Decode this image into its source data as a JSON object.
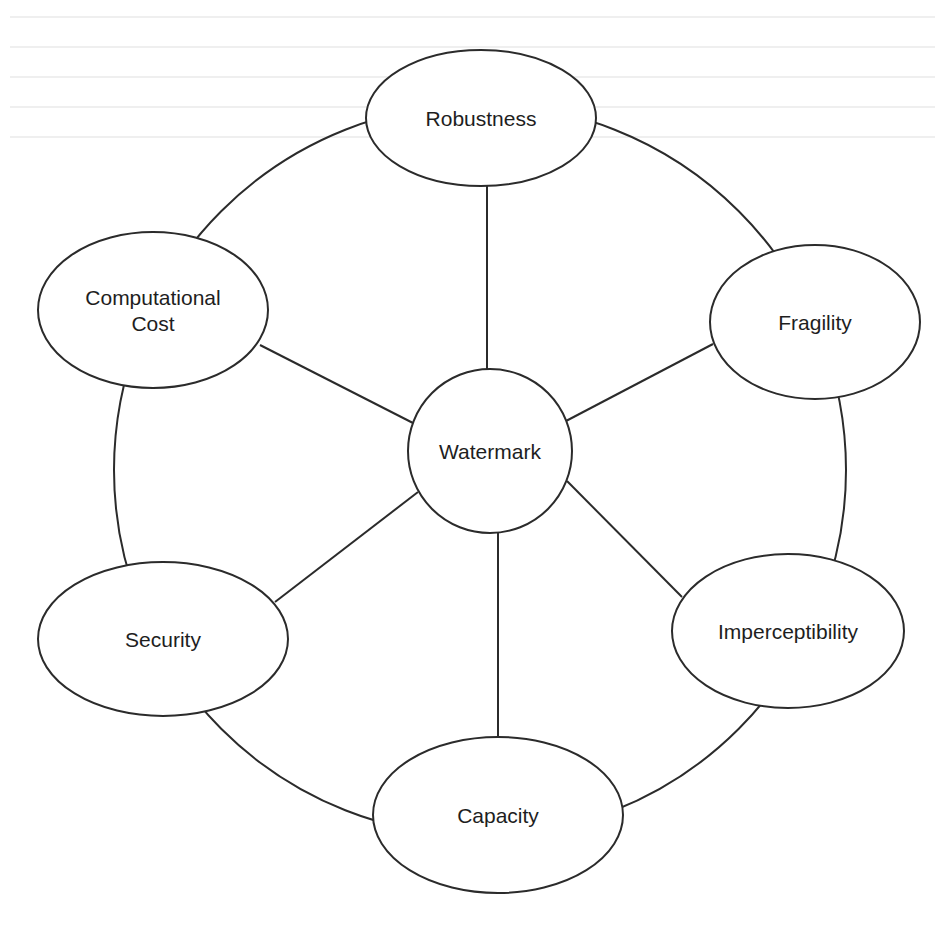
{
  "diagram": {
    "type": "hub-and-spoke concept diagram with outer ring",
    "center": {
      "id": "watermark",
      "label": "Watermark",
      "shape": "circle",
      "cx": 490,
      "cy": 451,
      "r": 82
    },
    "outer_ring": {
      "cx": 480,
      "cy": 470,
      "r": 366
    },
    "nodes": [
      {
        "id": "robustness",
        "label": "Robustness",
        "lines": [
          "Robustness"
        ],
        "cx": 481,
        "cy": 118,
        "rx": 115,
        "ry": 68
      },
      {
        "id": "fragility",
        "label": "Fragility",
        "lines": [
          "Fragility"
        ],
        "cx": 815,
        "cy": 322,
        "rx": 105,
        "ry": 77
      },
      {
        "id": "imperceptibility",
        "label": "Imperceptibility",
        "lines": [
          "Imperceptibility"
        ],
        "cx": 788,
        "cy": 631,
        "rx": 116,
        "ry": 77
      },
      {
        "id": "capacity",
        "label": "Capacity",
        "lines": [
          "Capacity"
        ],
        "cx": 498,
        "cy": 815,
        "rx": 125,
        "ry": 78
      },
      {
        "id": "security",
        "label": "Security",
        "lines": [
          "Security"
        ],
        "cx": 163,
        "cy": 639,
        "rx": 125,
        "ry": 77
      },
      {
        "id": "computational-cost",
        "label": "Computational Cost",
        "lines": [
          "Computational",
          "Cost"
        ],
        "cx": 153,
        "cy": 310,
        "rx": 115,
        "ry": 78
      }
    ],
    "spokes": [
      {
        "to": "robustness",
        "x1": 487,
        "y1": 369,
        "x2": 487,
        "y2": 186
      },
      {
        "to": "fragility",
        "x1": 566,
        "y1": 421,
        "x2": 713,
        "y2": 344
      },
      {
        "to": "imperceptibility",
        "x1": 567,
        "y1": 481,
        "x2": 682,
        "y2": 597
      },
      {
        "to": "capacity",
        "x1": 498,
        "y1": 533,
        "x2": 498,
        "y2": 737
      },
      {
        "to": "security",
        "x1": 418,
        "y1": 492,
        "x2": 275,
        "y2": 602
      },
      {
        "to": "computational-cost",
        "x1": 413,
        "y1": 423,
        "x2": 260,
        "y2": 345
      }
    ],
    "colors": {
      "stroke": "#2b2b2b",
      "text": "#1e1e1e",
      "fill": "#ffffff",
      "background": "#ffffff"
    }
  }
}
